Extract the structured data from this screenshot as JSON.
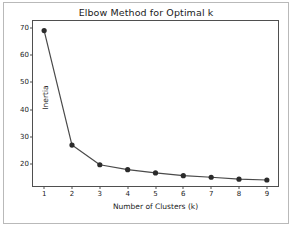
{
  "chart_data": {
    "type": "line",
    "title": "Elbow Method for Optimal k",
    "xlabel": "Number of Clusters (k)",
    "ylabel": "Inertia",
    "x": [
      1,
      2,
      3,
      4,
      5,
      6,
      7,
      8,
      9
    ],
    "values": [
      69,
      27,
      19.8,
      18,
      16.8,
      15.8,
      15.2,
      14.5,
      14.2
    ],
    "series": [
      {
        "name": "Inertia",
        "values": [
          69,
          27,
          19.8,
          18,
          16.8,
          15.8,
          15.2,
          14.5,
          14.2
        ]
      }
    ],
    "xticks": [
      "1",
      "2",
      "3",
      "4",
      "5",
      "6",
      "7",
      "8",
      "9"
    ],
    "yticks": [
      "20",
      "30",
      "40",
      "50",
      "60",
      "70"
    ],
    "xlim": [
      0.6,
      9.4
    ],
    "ylim": [
      12.0,
      72.5
    ],
    "grid": false,
    "legend": false,
    "line_color": "#4a4a4a",
    "marker_color": "#2b2b2b",
    "marker": "circle",
    "frame_color": "#4f4f4f",
    "background": "#ffffff"
  }
}
